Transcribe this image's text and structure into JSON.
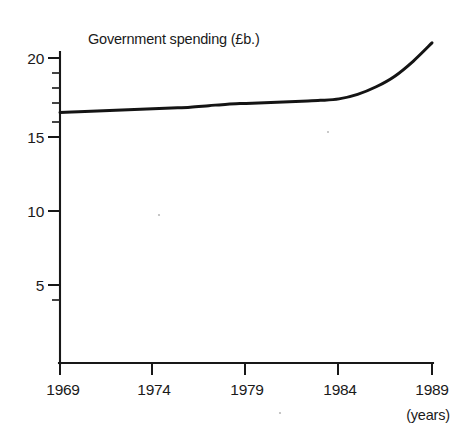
{
  "chart_data": {
    "type": "line",
    "title": "Government spending (£b.)",
    "xlabel": "(years)",
    "ylabel": "",
    "x": [
      1969,
      1970,
      1971,
      1972,
      1973,
      1974,
      1975,
      1976,
      1977,
      1978,
      1979,
      1980,
      1981,
      1982,
      1983,
      1984,
      1985,
      1986,
      1987,
      1988,
      1989
    ],
    "values": [
      16.4,
      16.45,
      16.5,
      16.55,
      16.6,
      16.65,
      16.7,
      16.75,
      16.85,
      16.95,
      17.0,
      17.05,
      17.1,
      17.15,
      17.2,
      17.3,
      17.6,
      18.1,
      18.8,
      19.8,
      21.0
    ],
    "series": [
      {
        "name": "Government spending",
        "values": [
          16.4,
          16.45,
          16.5,
          16.55,
          16.6,
          16.65,
          16.7,
          16.75,
          16.85,
          16.95,
          17.0,
          17.05,
          17.1,
          17.15,
          17.2,
          17.3,
          17.6,
          18.1,
          18.8,
          19.8,
          21.0
        ]
      }
    ],
    "xlim": [
      1969,
      1989
    ],
    "ylim": [
      0,
      21.5
    ],
    "x_tick_labels": [
      "1969",
      "1974",
      "1979",
      "1984",
      "1989"
    ],
    "x_tick_values": [
      1969,
      1974,
      1979,
      1984,
      1989
    ],
    "y_tick_labels": [
      "20",
      "15",
      "10",
      "5"
    ],
    "y_tick_values": [
      20,
      15,
      10,
      5
    ],
    "y_minor_tick_values": [
      21,
      19,
      18,
      17,
      16,
      4
    ],
    "grid": false,
    "legend": "none",
    "line_color": "#141414",
    "axis_color": "#181818",
    "background_color": "#ffffff"
  },
  "annotations": {
    "title_text": "Government spending (£b.)",
    "x_axis_unit": "(years)"
  }
}
